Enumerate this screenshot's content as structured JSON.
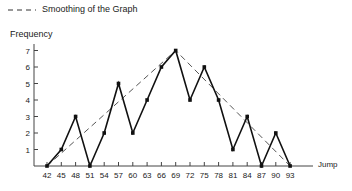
{
  "legend": {
    "label": "Smoothing of the Graph",
    "style": "dashed"
  },
  "chart_data": {
    "type": "line",
    "title": "",
    "xlabel": "Jump",
    "ylabel": "Frequency",
    "x": [
      42,
      45,
      48,
      51,
      54,
      57,
      60,
      63,
      66,
      69,
      72,
      75,
      78,
      81,
      84,
      87,
      90,
      93
    ],
    "series": [
      {
        "name": "Frequency",
        "style": "solid",
        "values": [
          0,
          1,
          3,
          0,
          2,
          5,
          2,
          4,
          6,
          7,
          4,
          6,
          4,
          1,
          3,
          0,
          2,
          0
        ]
      },
      {
        "name": "Smoothing of the Graph",
        "style": "dashed",
        "x": [
          42,
          69,
          93
        ],
        "values": [
          0,
          7,
          0
        ]
      }
    ],
    "yticks": [
      1,
      2,
      3,
      4,
      5,
      6,
      7
    ],
    "ylim": [
      0,
      7.5
    ],
    "xlim": [
      42,
      93
    ],
    "grid": false,
    "legend_position": "top-left"
  }
}
